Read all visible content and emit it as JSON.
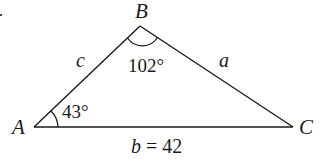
{
  "diagram": {
    "type": "triangle",
    "vertices": {
      "A": {
        "label": "A",
        "x": 34,
        "y": 127
      },
      "B": {
        "label": "B",
        "x": 140,
        "y": 26
      },
      "C": {
        "label": "C",
        "x": 293,
        "y": 127
      }
    },
    "sides": {
      "a": {
        "label": "a",
        "between": "B-C"
      },
      "b": {
        "label": "b = 42",
        "between": "A-C",
        "length": 42
      },
      "c": {
        "label": "c",
        "between": "A-B"
      }
    },
    "angles": {
      "A": {
        "label": "43°",
        "degrees": 43
      },
      "B": {
        "label": "102°",
        "degrees": 102
      }
    },
    "stroke_color": "#1a1a1a",
    "background": "#ffffff"
  }
}
